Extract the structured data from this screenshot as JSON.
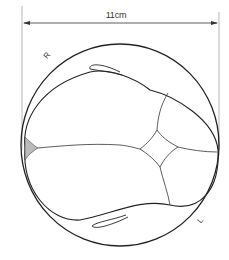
{
  "diagram": {
    "dimension": {
      "label": "11cm"
    },
    "labels": {
      "right": "R",
      "left": "L"
    },
    "colors": {
      "line": "#222222",
      "extension_line": "#888888",
      "background": "#ffffff"
    }
  }
}
